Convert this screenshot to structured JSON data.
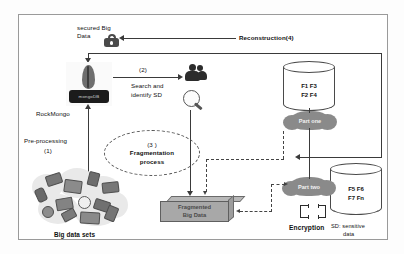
{
  "diagram": {
    "nodes": {
      "secured_big_data": "secured Big Data",
      "lock_icon": "padlock-icon",
      "mongo_badge": "mongoDB",
      "rockmongo": "RockMongo",
      "preprocessing": "Pre-processing (1)",
      "preprocessing_line1": "Pre-processing",
      "preprocessing_line2": "(1)",
      "step2": "(2)",
      "search_line1": "Search and",
      "search_line2": "identify SD",
      "frag_step": "(3 )",
      "frag_line1": "Fragmentation",
      "frag_line2": "process",
      "reconstruction": "Reconstruction(4)",
      "fragmented_line1": "Fragmented",
      "fragmented_line2": "Big Data",
      "part_one": "Part one",
      "part_two": "Part two",
      "encryption": "Encryption",
      "legend_line1": "SD: sensitive",
      "legend_line2": "data",
      "big_data_sets": "Big data sets"
    },
    "cylinders": [
      {
        "name": "cylinder-part-one",
        "row1": "F1   F3",
        "row2": "F2    F4"
      },
      {
        "name": "cylinder-part-two",
        "row1": "F5   F6",
        "row2": "F7   Fn"
      }
    ],
    "colors": {
      "frame_border": "#9a9a9a",
      "cloud_fill": "#8a8a8a",
      "box_fill": "#a8a8a8",
      "line": "#3a3a3a",
      "badge_bg": "#1b1b1b",
      "text": "#111111"
    }
  }
}
